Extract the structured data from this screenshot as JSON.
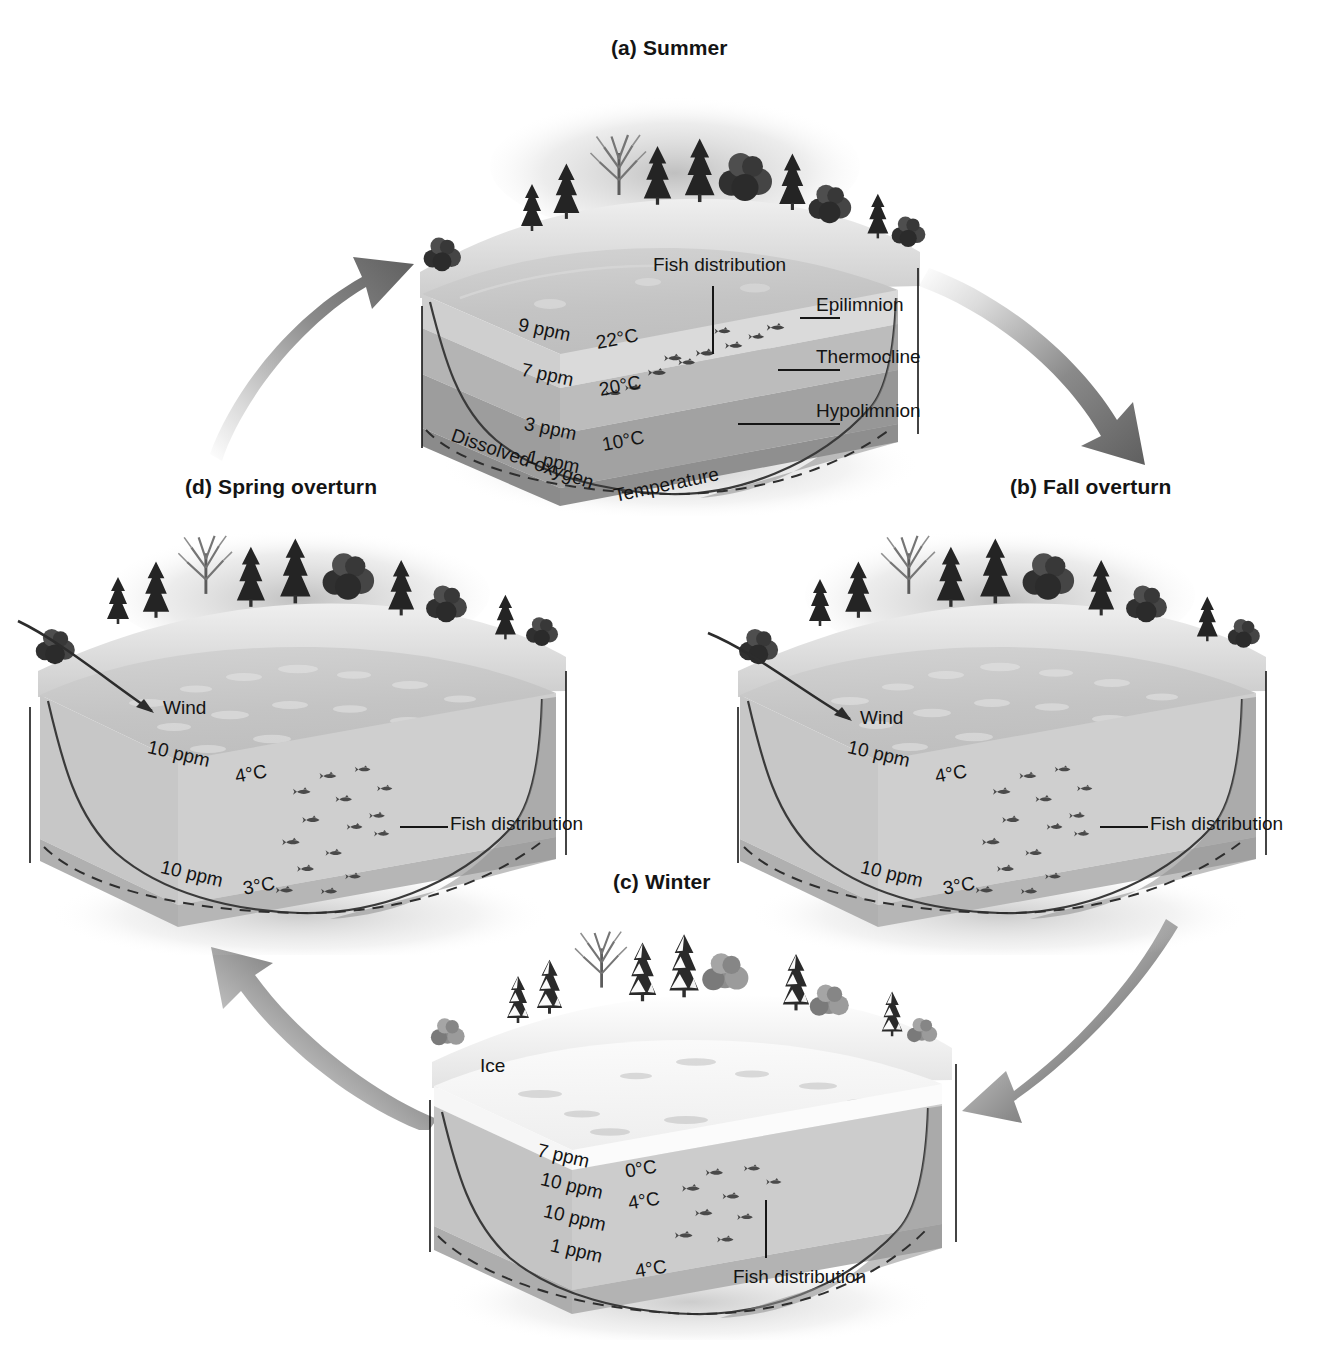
{
  "figure": {
    "cycle_direction": "clockwise"
  },
  "panels": [
    {
      "id": "summer",
      "title": "(a) Summer",
      "axis_labels": {
        "oxygen": "Dissolved oxygen",
        "temperature": "Temperature"
      },
      "callouts": [
        {
          "name": "fish-distribution",
          "label": "Fish distribution"
        },
        {
          "name": "epilimnion",
          "label": "Epilimnion"
        },
        {
          "name": "thermocline",
          "label": "Thermocline"
        },
        {
          "name": "hypolimnion",
          "label": "Hypolimnion"
        }
      ],
      "layers": [
        {
          "oxygen": "9 ppm",
          "temperature": "22°C"
        },
        {
          "oxygen": "7 ppm",
          "temperature": "20°C"
        },
        {
          "oxygen": "3 ppm",
          "temperature": "10°C"
        },
        {
          "oxygen": "1 ppm",
          "temperature": ""
        }
      ]
    },
    {
      "id": "fall-overturn",
      "title": "(b) Fall overturn",
      "callouts": [
        {
          "name": "wind",
          "label": "Wind"
        },
        {
          "name": "fish-distribution",
          "label": "Fish distribution"
        }
      ],
      "layers": [
        {
          "oxygen": "10 ppm",
          "temperature": "4°C"
        },
        {
          "oxygen": "10 ppm",
          "temperature": "3°C"
        }
      ]
    },
    {
      "id": "winter",
      "title": "(c) Winter",
      "callouts": [
        {
          "name": "ice",
          "label": "Ice"
        },
        {
          "name": "fish-distribution",
          "label": "Fish distribution"
        }
      ],
      "layers": [
        {
          "oxygen": "7 ppm",
          "temperature": "0°C"
        },
        {
          "oxygen": "10 ppm",
          "temperature": "4°C"
        },
        {
          "oxygen": "10 ppm",
          "temperature": ""
        },
        {
          "oxygen": "1 ppm",
          "temperature": "4°C"
        }
      ]
    },
    {
      "id": "spring-overturn",
      "title": "(d) Spring overturn",
      "callouts": [
        {
          "name": "wind",
          "label": "Wind"
        },
        {
          "name": "fish-distribution",
          "label": "Fish distribution"
        }
      ],
      "layers": [
        {
          "oxygen": "10 ppm",
          "temperature": "4°C"
        },
        {
          "oxygen": "10 ppm",
          "temperature": "3°C"
        }
      ]
    }
  ],
  "colors": {
    "background": "#ffffff",
    "text": "#141414",
    "arrow_dark": "#6e6e6e",
    "arrow_light": "#d8d8d8",
    "water_top": "#c9c9c9",
    "epilimnion": "#d5d5d5",
    "thermocline": "#a8a8a8",
    "hypolimnion": "#8f8f8f",
    "deep": "#7d7d7d",
    "side_face": "#9a9a9a",
    "ice": "#f2f2f2",
    "tree_dark": "#2b2b2b",
    "leader_line": "#161616"
  }
}
